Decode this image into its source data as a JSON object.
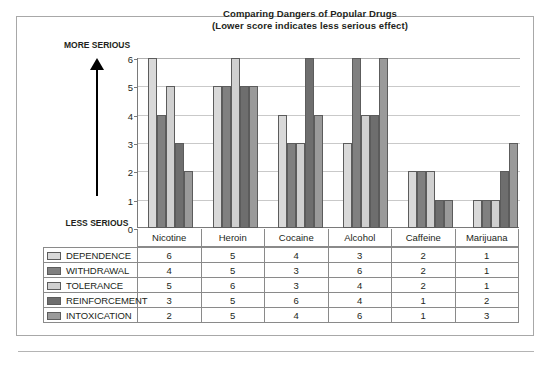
{
  "chart_data": {
    "type": "bar",
    "title": "Comparing Dangers of Popular Drugs",
    "subtitle": "(Lower score indicates less serious effect)",
    "xlabel": "",
    "ylabel": "",
    "ylim": [
      0,
      6
    ],
    "yticks": [
      0,
      1,
      2,
      3,
      4,
      5,
      6
    ],
    "grid": true,
    "legend_position": "bottom-table",
    "axis_direction_top": "MORE SERIOUS",
    "axis_direction_bottom": "LESS SERIOUS",
    "categories": [
      "Nicotine",
      "Heroin",
      "Cocaine",
      "Alcohol",
      "Caffeine",
      "Marijuana"
    ],
    "series": [
      {
        "name": "DEPENDENCE",
        "color": "#d9d9d9",
        "values": [
          6,
          5,
          4,
          3,
          2,
          1
        ]
      },
      {
        "name": "WITHDRAWAL",
        "color": "#808080",
        "values": [
          4,
          5,
          3,
          6,
          2,
          1
        ]
      },
      {
        "name": "TOLERANCE",
        "color": "#d0d0d0",
        "values": [
          5,
          6,
          3,
          4,
          2,
          1
        ]
      },
      {
        "name": "REINFORCEMENT",
        "color": "#6e6e6e",
        "values": [
          3,
          5,
          6,
          4,
          1,
          2
        ]
      },
      {
        "name": "INTOXICATION",
        "color": "#9a9a9a",
        "values": [
          2,
          5,
          4,
          6,
          1,
          3
        ]
      }
    ]
  }
}
